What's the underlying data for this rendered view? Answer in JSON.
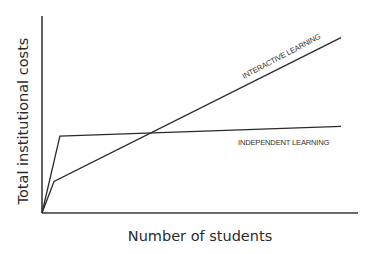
{
  "chart_data": {
    "type": "line",
    "title": "",
    "xlabel": "Number of students",
    "ylabel": "Total institutional costs",
    "grid": false,
    "legend": "inline labels",
    "x_ticks": [],
    "y_ticks": [],
    "xlim": [
      0,
      100
    ],
    "ylim": [
      0,
      100
    ],
    "series": [
      {
        "name": "INTERACTIVE LEARNING",
        "x": [
          0,
          4,
          100
        ],
        "y": [
          0,
          16,
          89
        ],
        "description": "Small fixed cost, then steep steady linear increase with number of students"
      },
      {
        "name": "INDEPENDENT LEARNING",
        "x": [
          0,
          6,
          100
        ],
        "y": [
          0,
          39,
          44
        ],
        "description": "High initial fixed cost, then nearly flat marginal cost per student"
      }
    ]
  },
  "labels": {
    "y_axis": "Total institutional costs",
    "x_axis": "Number of students",
    "interactive": "INTERACTIVE LEARNING",
    "independent": "INDEPENDENT LEARNING"
  }
}
